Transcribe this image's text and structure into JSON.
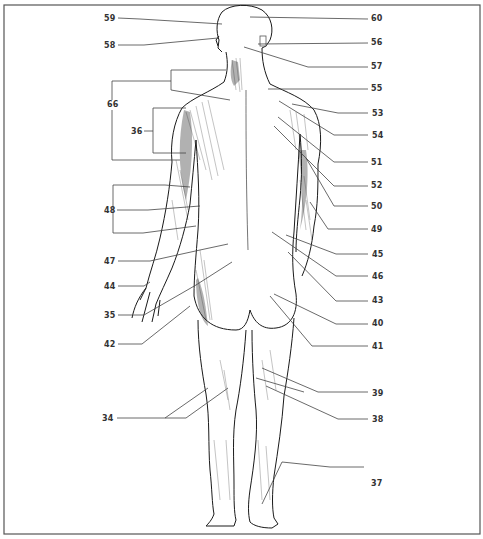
{
  "figure": {
    "frame": {
      "x": 4,
      "y": 5,
      "width": 476,
      "height": 529,
      "color": "#555555"
    },
    "line_color": "#444444",
    "figure_color": "#1a1a1a"
  },
  "labels": {
    "left": [
      {
        "id": "59",
        "text": "59",
        "x": 104,
        "y": 15
      },
      {
        "id": "58",
        "text": "58",
        "x": 104,
        "y": 43
      },
      {
        "id": "66",
        "text": "66",
        "x": 107,
        "y": 104
      },
      {
        "id": "36",
        "text": "36",
        "x": 131,
        "y": 130
      },
      {
        "id": "48",
        "text": "48",
        "x": 104,
        "y": 208
      },
      {
        "id": "47",
        "text": "47",
        "x": 104,
        "y": 258
      },
      {
        "id": "44",
        "text": "44",
        "x": 104,
        "y": 283
      },
      {
        "id": "35",
        "text": "35",
        "x": 104,
        "y": 313
      },
      {
        "id": "42",
        "text": "42",
        "x": 104,
        "y": 342
      },
      {
        "id": "34",
        "text": "34",
        "x": 102,
        "y": 416
      }
    ],
    "right": [
      {
        "id": "60",
        "text": "60",
        "x": 370,
        "y": 15
      },
      {
        "id": "56",
        "text": "56",
        "x": 370,
        "y": 39
      },
      {
        "id": "57",
        "text": "57",
        "x": 370,
        "y": 64
      },
      {
        "id": "55",
        "text": "55",
        "x": 370,
        "y": 86
      },
      {
        "id": "53",
        "text": "53",
        "x": 371,
        "y": 110
      },
      {
        "id": "54",
        "text": "54",
        "x": 371,
        "y": 132
      },
      {
        "id": "51",
        "text": "51",
        "x": 370,
        "y": 159
      },
      {
        "id": "52",
        "text": "52",
        "x": 370,
        "y": 182
      },
      {
        "id": "50",
        "text": "50",
        "x": 370,
        "y": 203
      },
      {
        "id": "49",
        "text": "49",
        "x": 370,
        "y": 226
      },
      {
        "id": "45",
        "text": "45",
        "x": 371,
        "y": 252
      },
      {
        "id": "46",
        "text": "46",
        "x": 371,
        "y": 274
      },
      {
        "id": "43",
        "text": "43",
        "x": 371,
        "y": 298
      },
      {
        "id": "40",
        "text": "40",
        "x": 371,
        "y": 321
      },
      {
        "id": "41",
        "text": "41",
        "x": 371,
        "y": 344
      },
      {
        "id": "39",
        "text": "39",
        "x": 371,
        "y": 391
      },
      {
        "id": "38",
        "text": "38",
        "x": 371,
        "y": 417
      },
      {
        "id": "37",
        "text": "37",
        "x": 370,
        "y": 481
      }
    ]
  }
}
